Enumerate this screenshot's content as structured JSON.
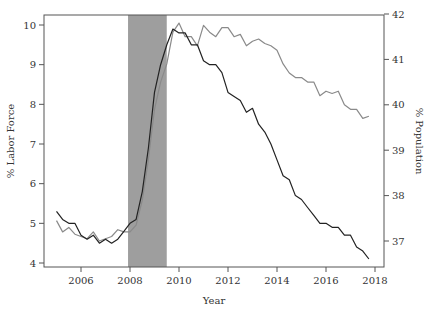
{
  "chart_data": {
    "type": "line",
    "title": "",
    "xlabel": "Year",
    "ylabel": "% Labor Force",
    "ylabel_right": "% Population",
    "xlim": [
      2004.5,
      2018.3
    ],
    "ylim": [
      3.9,
      10.25
    ],
    "ylim_right": [
      36.45,
      42
    ],
    "x_ticks": [
      2006,
      2008,
      2010,
      2012,
      2014,
      2016,
      2018
    ],
    "y_ticks": [
      4,
      5,
      6,
      7,
      8,
      9,
      10
    ],
    "y_ticks_right": [
      37,
      38,
      39,
      40,
      41,
      42
    ],
    "grid": false,
    "legend": null,
    "shaded_regions": [
      {
        "x0": 2007.92,
        "x1": 2009.5,
        "color": "#9e9e9e",
        "label": "Recession"
      }
    ],
    "series": [
      {
        "name": "% Labor Force",
        "axis": "left",
        "color": "#222222",
        "x": [
          2005.0,
          2005.25,
          2005.5,
          2005.75,
          2006.0,
          2006.25,
          2006.5,
          2006.75,
          2007.0,
          2007.25,
          2007.5,
          2007.75,
          2008.0,
          2008.25,
          2008.5,
          2008.75,
          2009.0,
          2009.25,
          2009.5,
          2009.75,
          2010.0,
          2010.25,
          2010.5,
          2010.75,
          2011.0,
          2011.25,
          2011.5,
          2011.75,
          2012.0,
          2012.25,
          2012.5,
          2012.75,
          2013.0,
          2013.25,
          2013.5,
          2013.75,
          2014.0,
          2014.25,
          2014.5,
          2014.75,
          2015.0,
          2015.25,
          2015.5,
          2015.75,
          2016.0,
          2016.25,
          2016.5,
          2016.75,
          2017.0,
          2017.25,
          2017.5,
          2017.75
        ],
        "y": [
          5.3,
          5.1,
          5.0,
          5.0,
          4.7,
          4.6,
          4.7,
          4.5,
          4.6,
          4.5,
          4.6,
          4.8,
          5.0,
          5.1,
          5.8,
          6.9,
          8.3,
          9.0,
          9.5,
          9.9,
          9.8,
          9.8,
          9.5,
          9.5,
          9.1,
          9.0,
          9.0,
          8.8,
          8.3,
          8.2,
          8.1,
          7.8,
          7.9,
          7.5,
          7.3,
          7.0,
          6.6,
          6.2,
          6.1,
          5.7,
          5.6,
          5.4,
          5.2,
          5.0,
          5.0,
          4.9,
          4.9,
          4.7,
          4.7,
          4.4,
          4.3,
          4.1
        ]
      },
      {
        "name": "% Population",
        "axis": "right",
        "color": "#8a8a8a",
        "x": [
          2005.0,
          2005.25,
          2005.5,
          2005.75,
          2006.0,
          2006.25,
          2006.5,
          2006.75,
          2007.0,
          2007.25,
          2007.5,
          2007.75,
          2008.0,
          2008.25,
          2008.5,
          2008.75,
          2009.0,
          2009.25,
          2009.5,
          2009.75,
          2010.0,
          2010.25,
          2010.5,
          2010.75,
          2011.0,
          2011.25,
          2011.5,
          2011.75,
          2012.0,
          2012.25,
          2012.5,
          2012.75,
          2013.0,
          2013.25,
          2013.5,
          2013.75,
          2014.0,
          2014.25,
          2014.5,
          2014.75,
          2015.0,
          2015.25,
          2015.5,
          2015.75,
          2016.0,
          2016.25,
          2016.5,
          2016.75,
          2017.0,
          2017.25,
          2017.5,
          2017.75
        ],
        "y": [
          37.45,
          37.2,
          37.3,
          37.15,
          37.1,
          37.05,
          37.2,
          37.0,
          37.05,
          37.1,
          37.25,
          37.2,
          37.2,
          37.35,
          37.9,
          38.8,
          39.9,
          40.5,
          40.9,
          41.6,
          41.8,
          41.5,
          41.5,
          41.3,
          41.75,
          41.6,
          41.5,
          41.7,
          41.7,
          41.5,
          41.55,
          41.3,
          41.4,
          41.45,
          41.35,
          41.3,
          41.2,
          40.9,
          40.7,
          40.6,
          40.6,
          40.5,
          40.5,
          40.2,
          40.3,
          40.25,
          40.3,
          40.0,
          39.9,
          39.9,
          39.7,
          39.75
        ]
      }
    ]
  }
}
